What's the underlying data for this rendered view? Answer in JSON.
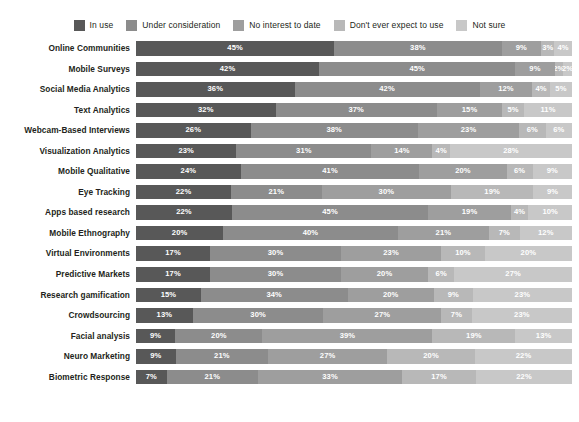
{
  "legend": {
    "items": [
      {
        "label": "In use",
        "color": "#585858",
        "swatch_name": "legend-swatch-in-use"
      },
      {
        "label": "Under consideration",
        "color": "#8c8c8c",
        "swatch_name": "legend-swatch-under-consideration"
      },
      {
        "label": "No interest to date",
        "color": "#9e9e9e",
        "swatch_name": "legend-swatch-no-interest"
      },
      {
        "label": "Don't ever expect to use",
        "color": "#b8b8b8",
        "swatch_name": "legend-swatch-dont-expect"
      },
      {
        "label": "Not sure",
        "color": "#c8c8c8",
        "swatch_name": "legend-swatch-not-sure"
      }
    ]
  },
  "chart_data": {
    "type": "bar",
    "orientation": "horizontal",
    "stacked": true,
    "stack_mode": "percent",
    "title": "",
    "subtitle": "",
    "xlabel": "",
    "ylabel": "",
    "xlim": [
      0,
      100
    ],
    "grid": false,
    "legend_position": "top",
    "value_suffix": "%",
    "series_colors": [
      "#585858",
      "#8c8c8c",
      "#9e9e9e",
      "#b8b8b8",
      "#c8c8c8"
    ],
    "categories": [
      "Online Communities",
      "Mobile Surveys",
      "Social Media Analytics",
      "Text Analytics",
      "Webcam-Based Interviews",
      "Visualization Analytics",
      "Mobile Qualitative",
      "Eye Tracking",
      "Apps based research",
      "Mobile Ethnography",
      "Virtual Environments",
      "Predictive Markets",
      "Research gamification",
      "Crowdsourcing",
      "Facial analysis",
      "Neuro Marketing",
      "Biometric Response"
    ],
    "series": [
      {
        "name": "In use",
        "color": "#585858",
        "values": [
          45,
          42,
          36,
          32,
          26,
          23,
          24,
          22,
          22,
          20,
          17,
          17,
          15,
          13,
          9,
          9,
          7
        ]
      },
      {
        "name": "Under consideration",
        "color": "#8c8c8c",
        "values": [
          38,
          45,
          42,
          37,
          38,
          31,
          41,
          21,
          45,
          40,
          30,
          30,
          34,
          30,
          20,
          21,
          21
        ]
      },
      {
        "name": "No interest to date",
        "color": "#9e9e9e",
        "values": [
          9,
          9,
          12,
          15,
          23,
          14,
          20,
          30,
          19,
          21,
          23,
          20,
          20,
          27,
          39,
          27,
          33
        ]
      },
      {
        "name": "Don't ever expect to use",
        "color": "#b8b8b8",
        "values": [
          3,
          2,
          4,
          5,
          6,
          4,
          6,
          19,
          4,
          7,
          10,
          6,
          9,
          7,
          19,
          20,
          17
        ]
      },
      {
        "name": "Not sure",
        "color": "#c8c8c8",
        "values": [
          4,
          2,
          5,
          11,
          6,
          28,
          9,
          9,
          10,
          12,
          20,
          27,
          23,
          23,
          13,
          22,
          22
        ]
      }
    ],
    "rows": [
      {
        "category": "Online Communities",
        "values": [
          45,
          38,
          9,
          3,
          4
        ]
      },
      {
        "category": "Mobile Surveys",
        "values": [
          42,
          45,
          9,
          2,
          2
        ]
      },
      {
        "category": "Social Media Analytics",
        "values": [
          36,
          42,
          12,
          4,
          5
        ]
      },
      {
        "category": "Text Analytics",
        "values": [
          32,
          37,
          15,
          5,
          11
        ]
      },
      {
        "category": "Webcam-Based Interviews",
        "values": [
          26,
          38,
          23,
          6,
          6
        ]
      },
      {
        "category": "Visualization Analytics",
        "values": [
          23,
          31,
          14,
          4,
          28
        ]
      },
      {
        "category": "Mobile Qualitative",
        "values": [
          24,
          41,
          20,
          6,
          9
        ]
      },
      {
        "category": "Eye Tracking",
        "values": [
          22,
          21,
          30,
          19,
          9
        ]
      },
      {
        "category": "Apps based research",
        "values": [
          22,
          45,
          19,
          4,
          10
        ]
      },
      {
        "category": "Mobile Ethnography",
        "values": [
          20,
          40,
          21,
          7,
          12
        ]
      },
      {
        "category": "Virtual Environments",
        "values": [
          17,
          30,
          23,
          10,
          20
        ]
      },
      {
        "category": "Predictive Markets",
        "values": [
          17,
          30,
          20,
          6,
          27
        ]
      },
      {
        "category": "Research gamification",
        "values": [
          15,
          34,
          20,
          9,
          23
        ]
      },
      {
        "category": "Crowdsourcing",
        "values": [
          13,
          30,
          27,
          7,
          23
        ]
      },
      {
        "category": "Facial analysis",
        "values": [
          9,
          20,
          39,
          19,
          13
        ]
      },
      {
        "category": "Neuro Marketing",
        "values": [
          9,
          21,
          27,
          20,
          22
        ]
      },
      {
        "category": "Biometric Response",
        "values": [
          7,
          21,
          33,
          17,
          22
        ]
      }
    ]
  }
}
